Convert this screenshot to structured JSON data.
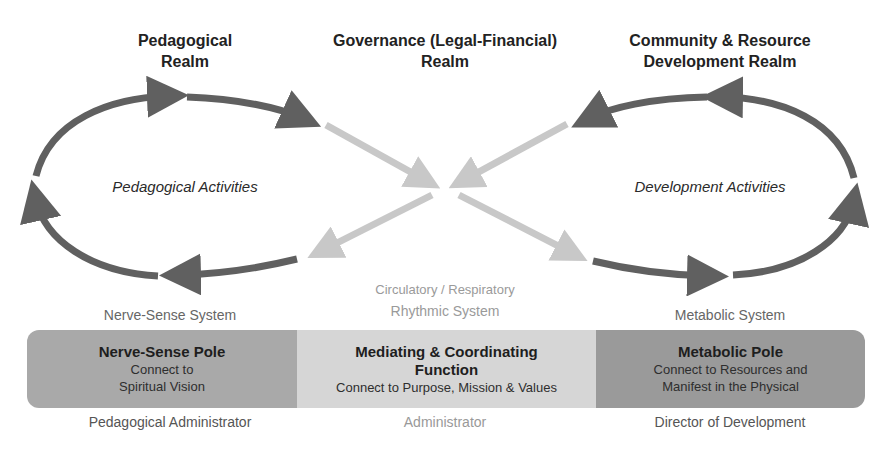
{
  "realms": {
    "pedagogical": {
      "line1": "Pedagogical",
      "line2": "Realm"
    },
    "governance": {
      "line1": "Governance (Legal-Financial)",
      "line2": "Realm"
    },
    "community": {
      "line1": "Community & Resource",
      "line2": "Development Realm"
    }
  },
  "activities": {
    "left": "Pedagogical Activities",
    "right": "Development Activities"
  },
  "systems": {
    "nerve_sense": "Nerve-Sense System",
    "rhythmic_line1": "Circulatory / Respiratory",
    "rhythmic_line2": "Rhythmic System",
    "metabolic": "Metabolic System"
  },
  "poles": {
    "nerve_sense": {
      "title": "Nerve-Sense Pole",
      "sub1": "Connect to",
      "sub2": "Spiritual Vision",
      "color": "#a9a9a9"
    },
    "mediating": {
      "title1": "Mediating & Coordinating",
      "title2": "Function",
      "sub": "Connect to Purpose, Mission & Values",
      "color": "#d6d6d6"
    },
    "metabolic": {
      "title": "Metabolic Pole",
      "sub1": "Connect to Resources and",
      "sub2": "Manifest in the Physical",
      "color": "#9a9a9a"
    }
  },
  "roles": {
    "left": "Pedagogical Administrator",
    "center": "Administrator",
    "right": "Director of Development"
  },
  "colors": {
    "dark_arrow": "#606060",
    "light_arrow": "#c8c8c8"
  }
}
